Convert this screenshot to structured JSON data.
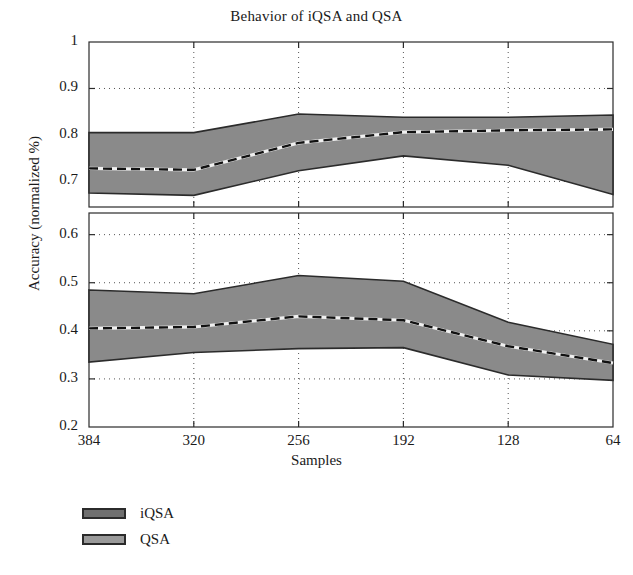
{
  "chart_data": {
    "type": "area",
    "title": "Behavior of iQSA and QSA",
    "xlabel": "Samples",
    "ylabel": "Accuracy (normalized %)",
    "x": [
      384,
      320,
      256,
      192,
      128,
      64
    ],
    "xtick_labels": [
      "384",
      "320",
      "256",
      "192",
      "128",
      "64"
    ],
    "grid": true,
    "grid_style": "dotted",
    "legend_position": "below-left",
    "axis_break": true,
    "panels": [
      {
        "name": "upper-panel",
        "ylim": [
          0.645,
          1.0
        ],
        "ytick_labels": [
          "0.7",
          "0.8",
          "0.9",
          "1"
        ],
        "yticks": [
          0.7,
          0.8,
          0.9,
          1.0
        ]
      },
      {
        "name": "lower-panel",
        "ylim": [
          0.2,
          0.645
        ],
        "ytick_labels": [
          "0.2",
          "0.3",
          "0.4",
          "0.5",
          "0.6"
        ],
        "yticks": [
          0.2,
          0.3,
          0.4,
          0.5,
          0.6
        ]
      }
    ],
    "series": [
      {
        "name": "iQSA",
        "panel": "upper-panel",
        "fill_color": "#8a8a8a",
        "edge_color": "#2b2b2b",
        "mean_line_style": "dashed",
        "mean_line_color": "#111111",
        "upper": [
          0.805,
          0.805,
          0.845,
          0.838,
          0.838,
          0.843
        ],
        "mean": [
          0.728,
          0.725,
          0.783,
          0.806,
          0.81,
          0.812
        ],
        "lower": [
          0.675,
          0.67,
          0.723,
          0.755,
          0.735,
          0.672
        ]
      },
      {
        "name": "QSA",
        "panel": "lower-panel",
        "fill_color": "#8a8a8a",
        "edge_color": "#2b2b2b",
        "mean_line_style": "dashed",
        "mean_line_color": "#111111",
        "upper": [
          0.485,
          0.477,
          0.515,
          0.503,
          0.418,
          0.372
        ],
        "mean": [
          0.405,
          0.408,
          0.43,
          0.422,
          0.368,
          0.333
        ],
        "lower": [
          0.335,
          0.355,
          0.363,
          0.365,
          0.308,
          0.297
        ]
      }
    ],
    "legend": [
      {
        "label": "iQSA",
        "color": "#6f6f6f"
      },
      {
        "label": "QSA",
        "color": "#9a9a9a"
      }
    ]
  }
}
